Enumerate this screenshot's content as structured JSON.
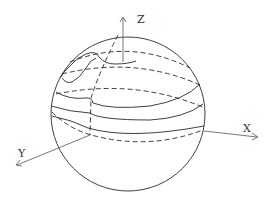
{
  "figure": {
    "type": "sphere-coordinate-diagram",
    "axes": {
      "x": {
        "label": "X"
      },
      "y": {
        "label": "Y"
      },
      "z": {
        "label": "Z"
      }
    },
    "colors": {
      "stroke": "#2a2a2a",
      "axis": "#555555",
      "background": "#ffffff"
    },
    "elements": [
      "sphere-outline",
      "latitude-curves-solid",
      "latitude-curves-dashed",
      "meridian-dashed",
      "irregular-boundary-curve"
    ]
  }
}
